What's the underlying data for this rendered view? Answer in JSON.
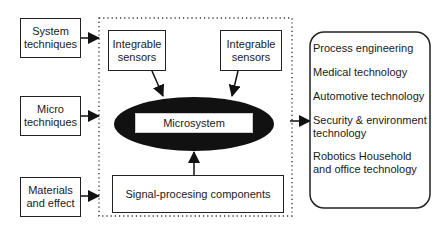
{
  "diagram": {
    "inputs": [
      {
        "label": "System techniques"
      },
      {
        "label": "Micro techniques"
      },
      {
        "label": "Materials and effect"
      }
    ],
    "sensors": [
      {
        "label": "Integrable sensors"
      },
      {
        "label": "Integrable sensors"
      }
    ],
    "core": {
      "label": "Microsystem"
    },
    "signal": {
      "label": "Signal-procesing components"
    },
    "applications": [
      {
        "label": "Process engineering"
      },
      {
        "label": "Medical technology"
      },
      {
        "label": "Automotive technology"
      },
      {
        "label": "Security & environment technology"
      },
      {
        "label": "Robotics Household and office technology"
      }
    ],
    "colors": {
      "ellipse": "#111111",
      "line": "#222222",
      "dotted": "#333333"
    }
  }
}
